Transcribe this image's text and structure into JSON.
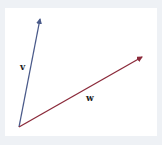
{
  "diagram": {
    "title": "",
    "origin": {
      "x": 19,
      "y": 127
    },
    "vectors": [
      {
        "name": "v",
        "label": "v",
        "tip": {
          "x": 40,
          "y": 19
        },
        "color": "#4a5a8a",
        "label_pos": {
          "x": 20,
          "y": 70
        }
      },
      {
        "name": "w",
        "label": "w",
        "tip": {
          "x": 142,
          "y": 57
        },
        "color": "#8b2a3a",
        "label_pos": {
          "x": 86,
          "y": 101
        }
      }
    ]
  },
  "colors": {
    "background": "#eef1f5",
    "panel": "#ffffff",
    "v": "#4a5a8a",
    "w": "#8b2a3a"
  }
}
